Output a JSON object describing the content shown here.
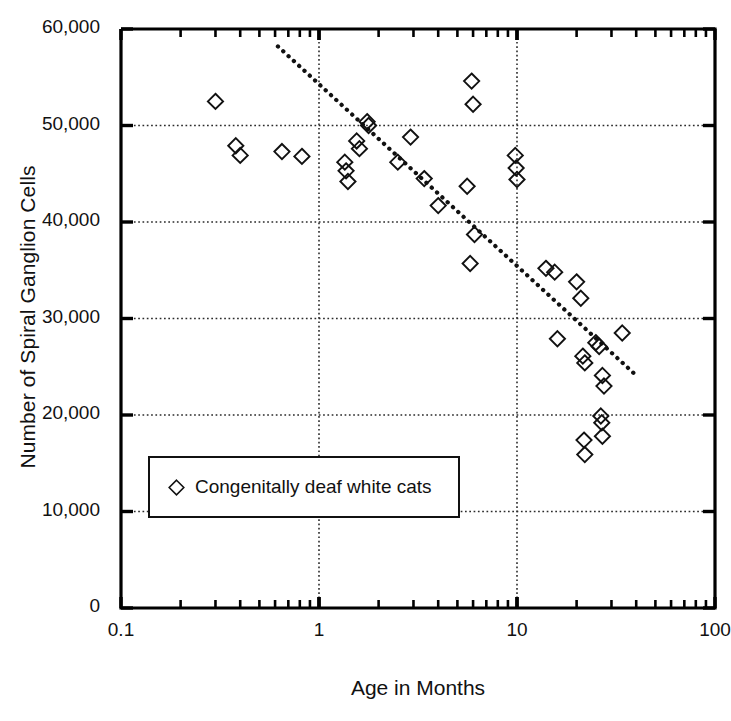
{
  "chart_data": {
    "type": "scatter",
    "title": "",
    "xlabel": "Age in Months",
    "ylabel": "Number of Spiral Ganglion Cells",
    "xscale": "log",
    "yscale": "linear",
    "xlim": [
      0.1,
      100
    ],
    "ylim": [
      0,
      60000
    ],
    "grid": true,
    "grid_style": "dotted",
    "legend": {
      "position": "lower-left-inside",
      "entries": [
        {
          "label": "Congenitally deaf white cats",
          "marker": "diamond-open"
        }
      ]
    },
    "xticks": [
      {
        "value": 0.1,
        "label": "0.1"
      },
      {
        "value": 1,
        "label": "1"
      },
      {
        "value": 10,
        "label": "10"
      },
      {
        "value": 100,
        "label": "100"
      }
    ],
    "yticks": [
      {
        "value": 0,
        "label": "0"
      },
      {
        "value": 10000,
        "label": "10,000"
      },
      {
        "value": 20000,
        "label": "20,000"
      },
      {
        "value": 30000,
        "label": "30,000"
      },
      {
        "value": 40000,
        "label": "40,000"
      },
      {
        "value": 50000,
        "label": "50,000"
      },
      {
        "value": 60000,
        "label": "60,000"
      }
    ],
    "series": [
      {
        "name": "Congenitally deaf white cats",
        "marker": "diamond-open",
        "points": [
          {
            "x": 0.3,
            "y": 52500
          },
          {
            "x": 0.38,
            "y": 47900
          },
          {
            "x": 0.4,
            "y": 46900
          },
          {
            "x": 0.65,
            "y": 47300
          },
          {
            "x": 0.82,
            "y": 46800
          },
          {
            "x": 1.35,
            "y": 46200
          },
          {
            "x": 1.37,
            "y": 45300
          },
          {
            "x": 1.4,
            "y": 44200
          },
          {
            "x": 1.55,
            "y": 48400
          },
          {
            "x": 1.6,
            "y": 47600
          },
          {
            "x": 1.75,
            "y": 50400
          },
          {
            "x": 1.78,
            "y": 50000
          },
          {
            "x": 2.5,
            "y": 46200
          },
          {
            "x": 2.9,
            "y": 48800
          },
          {
            "x": 3.4,
            "y": 44500
          },
          {
            "x": 4.0,
            "y": 41700
          },
          {
            "x": 5.6,
            "y": 43700
          },
          {
            "x": 5.9,
            "y": 54600
          },
          {
            "x": 6.0,
            "y": 52200
          },
          {
            "x": 6.1,
            "y": 38700
          },
          {
            "x": 5.8,
            "y": 35700
          },
          {
            "x": 9.8,
            "y": 46900
          },
          {
            "x": 9.9,
            "y": 45600
          },
          {
            "x": 10.0,
            "y": 44400
          },
          {
            "x": 14.0,
            "y": 35200
          },
          {
            "x": 15.5,
            "y": 34800
          },
          {
            "x": 16.0,
            "y": 27900
          },
          {
            "x": 20.0,
            "y": 33800
          },
          {
            "x": 21.0,
            "y": 32100
          },
          {
            "x": 21.5,
            "y": 26100
          },
          {
            "x": 22.0,
            "y": 25400
          },
          {
            "x": 21.8,
            "y": 17400
          },
          {
            "x": 22.0,
            "y": 15900
          },
          {
            "x": 25.0,
            "y": 27500
          },
          {
            "x": 26.0,
            "y": 27100
          },
          {
            "x": 27.0,
            "y": 24100
          },
          {
            "x": 27.5,
            "y": 23000
          },
          {
            "x": 26.5,
            "y": 19900
          },
          {
            "x": 26.8,
            "y": 19200
          },
          {
            "x": 27.0,
            "y": 17800
          },
          {
            "x": 34.0,
            "y": 28500
          }
        ]
      }
    ],
    "trendline": {
      "style": "dotted",
      "start": {
        "x": 0.62,
        "y": 58200
      },
      "end": {
        "x": 41.0,
        "y": 23900
      }
    }
  }
}
